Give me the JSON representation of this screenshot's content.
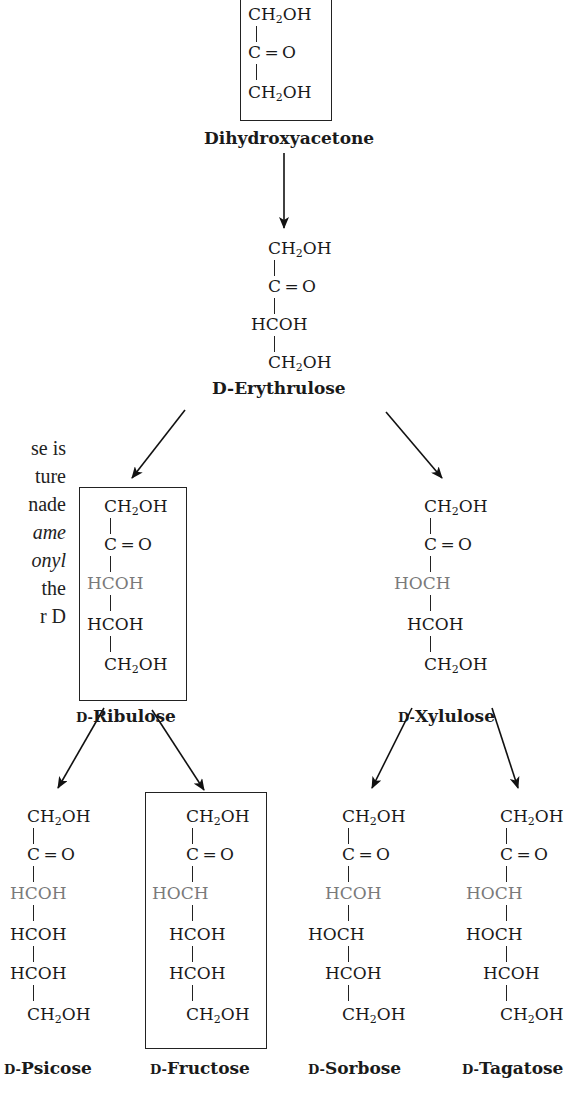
{
  "diagram": {
    "highlight_color": "#7a7a7a",
    "line_color": "#222222",
    "side_text": {
      "lines": [
        "se is",
        "ture",
        "nade",
        "ame",
        "onyl",
        " the",
        "r D"
      ],
      "italic_lines": [
        3,
        4
      ]
    },
    "molecules": {
      "dihydroxyacetone": {
        "name": "Dihydroxyacetone",
        "boxed": true,
        "rows": [
          {
            "pre": "CH",
            "sub": "2",
            "post": "OH",
            "hl": false
          },
          {
            "pre": "C=O",
            "sub": "",
            "post": "",
            "hl": false
          },
          {
            "pre": "CH",
            "sub": "2",
            "post": "OH",
            "hl": false
          }
        ]
      },
      "erythrulose": {
        "prefix": "D-",
        "name": "Erythrulose",
        "boxed": false,
        "rows": [
          {
            "pre": "CH",
            "sub": "2",
            "post": "OH"
          },
          {
            "pre": "C=O",
            "sub": "",
            "post": ""
          },
          {
            "pre": "HCOH",
            "sub": "",
            "post": ""
          },
          {
            "pre": "CH",
            "sub": "2",
            "post": "OH"
          }
        ]
      },
      "ribulose": {
        "prefix": "D-",
        "name": "Ribulose",
        "boxed": true,
        "rows": [
          {
            "pre": "CH",
            "sub": "2",
            "post": "OH"
          },
          {
            "pre": "C=O",
            "sub": "",
            "post": ""
          },
          {
            "pre": "HCOH",
            "sub": "",
            "post": "",
            "hl": true
          },
          {
            "pre": "HCOH",
            "sub": "",
            "post": ""
          },
          {
            "pre": "CH",
            "sub": "2",
            "post": "OH"
          }
        ]
      },
      "xylulose": {
        "prefix": "D-",
        "name": "Xylulose",
        "boxed": false,
        "rows": [
          {
            "pre": "CH",
            "sub": "2",
            "post": "OH"
          },
          {
            "pre": "C=O",
            "sub": "",
            "post": ""
          },
          {
            "pre": "HOCH",
            "sub": "",
            "post": "",
            "hl": true
          },
          {
            "pre": "HCOH",
            "sub": "",
            "post": ""
          },
          {
            "pre": "CH",
            "sub": "2",
            "post": "OH"
          }
        ]
      },
      "psicose": {
        "prefix": "D-",
        "name": "Psicose",
        "boxed": false,
        "rows": [
          {
            "pre": "CH",
            "sub": "2",
            "post": "OH"
          },
          {
            "pre": "C=O",
            "sub": "",
            "post": ""
          },
          {
            "pre": "HCOH",
            "sub": "",
            "post": "",
            "hl": true
          },
          {
            "pre": "HCOH",
            "sub": "",
            "post": ""
          },
          {
            "pre": "HCOH",
            "sub": "",
            "post": ""
          },
          {
            "pre": "CH",
            "sub": "2",
            "post": "OH"
          }
        ]
      },
      "fructose": {
        "prefix": "D-",
        "name": "Fructose",
        "boxed": true,
        "rows": [
          {
            "pre": "CH",
            "sub": "2",
            "post": "OH"
          },
          {
            "pre": "C=O",
            "sub": "",
            "post": ""
          },
          {
            "pre": "HOCH",
            "sub": "",
            "post": "",
            "hl": true
          },
          {
            "pre": "HCOH",
            "sub": "",
            "post": ""
          },
          {
            "pre": "HCOH",
            "sub": "",
            "post": ""
          },
          {
            "pre": "CH",
            "sub": "2",
            "post": "OH"
          }
        ]
      },
      "sorbose": {
        "prefix": "D-",
        "name": "Sorbose",
        "boxed": false,
        "rows": [
          {
            "pre": "CH",
            "sub": "2",
            "post": "OH"
          },
          {
            "pre": "C=O",
            "sub": "",
            "post": ""
          },
          {
            "pre": "HCOH",
            "sub": "",
            "post": "",
            "hl": true
          },
          {
            "pre": "HOCH",
            "sub": "",
            "post": ""
          },
          {
            "pre": "HCOH",
            "sub": "",
            "post": ""
          },
          {
            "pre": "CH",
            "sub": "2",
            "post": "OH"
          }
        ]
      },
      "tagatose": {
        "prefix": "D-",
        "name": "Tagatose",
        "boxed": false,
        "rows": [
          {
            "pre": "CH",
            "sub": "2",
            "post": "OH"
          },
          {
            "pre": "C=O",
            "sub": "",
            "post": ""
          },
          {
            "pre": "HOCH",
            "sub": "",
            "post": "",
            "hl": true
          },
          {
            "pre": "HOCH",
            "sub": "",
            "post": ""
          },
          {
            "pre": "HCOH",
            "sub": "",
            "post": ""
          },
          {
            "pre": "CH",
            "sub": "2",
            "post": "OH"
          }
        ]
      }
    },
    "arrows": [
      {
        "from": "dihydroxyacetone",
        "to": "erythrulose"
      },
      {
        "from": "erythrulose",
        "to": "ribulose"
      },
      {
        "from": "erythrulose",
        "to": "xylulose"
      },
      {
        "from": "ribulose",
        "to": "psicose"
      },
      {
        "from": "ribulose",
        "to": "fructose"
      },
      {
        "from": "xylulose",
        "to": "sorbose"
      },
      {
        "from": "xylulose",
        "to": "tagatose"
      }
    ]
  }
}
